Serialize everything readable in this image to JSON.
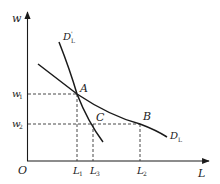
{
  "diagram": {
    "type": "labor-demand-curves",
    "axes": {
      "y_label": "w",
      "x_label": "L",
      "origin_label": "O"
    },
    "y_ticks": [
      {
        "label": "w",
        "sub": "1"
      },
      {
        "label": "w",
        "sub": "2"
      }
    ],
    "x_ticks": [
      {
        "label": "L",
        "sub": "1"
      },
      {
        "label": "L",
        "sub": "3"
      },
      {
        "label": "L",
        "sub": "2"
      }
    ],
    "curves": [
      {
        "name": "D",
        "sub": "L",
        "sup": "",
        "description": "flatter demand curve"
      },
      {
        "name": "D",
        "sub": "L",
        "sup": "'",
        "description": "steeper demand curve"
      }
    ],
    "points": [
      {
        "label": "A"
      },
      {
        "label": "B"
      },
      {
        "label": "C"
      }
    ],
    "colors": {
      "line": "#1a1a1a",
      "dashed": "#333333"
    }
  }
}
